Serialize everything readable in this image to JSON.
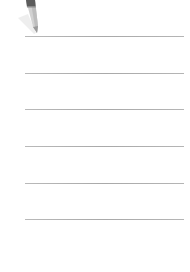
{
  "icon": {
    "name": "pencil-icon",
    "color_body": "#cfcfcf",
    "color_band": "#5a5a5a",
    "color_shadow": "#e6e6e6"
  },
  "rules": {
    "color": "#b0b0b0",
    "positions_y": [
      36,
      73,
      109,
      146,
      183,
      219
    ],
    "x_start": 25,
    "x_end": 184
  }
}
